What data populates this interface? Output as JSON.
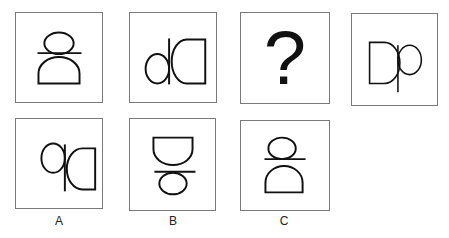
{
  "puzzle": {
    "sequence": [
      {
        "id": "panel-1",
        "figure": "D rotated 90° ccw with b-loop on top (stacked)"
      },
      {
        "id": "panel-2",
        "figure": "dD (mirrored Dp)"
      },
      {
        "id": "panel-3",
        "figure": "question mark",
        "text": "?"
      },
      {
        "id": "panel-4",
        "figure": "Dp"
      }
    ],
    "options": [
      {
        "label": "A",
        "figure": "qD (Dp rotated 180°)"
      },
      {
        "label": "B",
        "figure": "D on top, b-loop below (stacked)"
      },
      {
        "label": "C",
        "figure": "loop on top, D below (stacked)"
      }
    ],
    "colors": {
      "stroke": "#111111",
      "border": "#7a7a7a",
      "background": "#ffffff"
    }
  }
}
